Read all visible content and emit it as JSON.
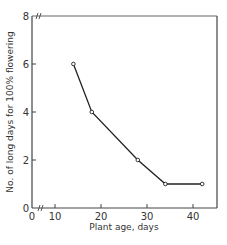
{
  "chart_data": {
    "type": "line",
    "title": "",
    "xlabel": "Plant age, days",
    "ylabel": "No. of long days for 100% flowering",
    "x": [
      14,
      18,
      28,
      34,
      42
    ],
    "values": [
      6,
      4,
      2,
      1,
      1
    ],
    "series": [
      {
        "name": "Long days required",
        "x": [
          14,
          18,
          28,
          34,
          42
        ],
        "values": [
          6,
          4,
          2,
          1,
          1
        ]
      }
    ],
    "xticks": [
      "0",
      "10",
      "20",
      "30",
      "40"
    ],
    "yticks": [
      "0",
      "2",
      "4",
      "6",
      "8"
    ],
    "xlim": [
      0,
      45
    ],
    "ylim": [
      0,
      8
    ],
    "axis_breaks": {
      "x": true,
      "y": true
    },
    "grid": false,
    "legend": null,
    "marker": "open-circle",
    "colors": {
      "line": "#222222",
      "axis": "#444444"
    }
  }
}
